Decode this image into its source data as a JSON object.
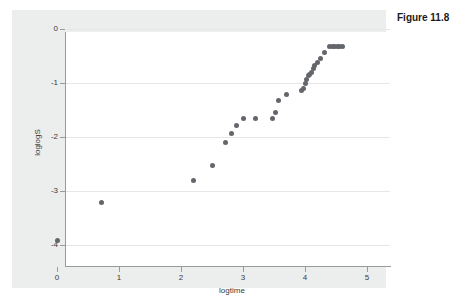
{
  "caption": {
    "text": "Figure 11.8"
  },
  "chart_data": {
    "type": "scatter",
    "title": "",
    "xlabel": "logtime",
    "ylabel": "loglogS",
    "xlim": [
      -0.05,
      5.25
    ],
    "ylim": [
      -4.3,
      0.12
    ],
    "xticks": [
      0,
      1,
      2,
      3,
      4,
      5
    ],
    "xtick_labels": [
      "0",
      "1",
      "2",
      "3",
      "4",
      "5"
    ],
    "yticks": [
      0,
      -1,
      -2,
      -3,
      -4
    ],
    "ytick_labels": [
      "0",
      "-1",
      "-2",
      "-3",
      "-4"
    ],
    "grid": "horizontal",
    "legend": "none",
    "marker_color": "#63666a",
    "series": [
      {
        "name": "loglogS vs logtime",
        "points": [
          [
            0.0,
            -3.91
          ],
          [
            0.72,
            -3.22
          ],
          [
            2.2,
            -2.81
          ],
          [
            2.5,
            -2.52
          ],
          [
            2.72,
            -2.11
          ],
          [
            2.82,
            -1.93
          ],
          [
            2.9,
            -1.78
          ],
          [
            3.0,
            -1.65
          ],
          [
            3.2,
            -1.65
          ],
          [
            3.48,
            -1.65
          ],
          [
            3.52,
            -1.55
          ],
          [
            3.58,
            -1.33
          ],
          [
            3.7,
            -1.22
          ],
          [
            3.94,
            -1.14
          ],
          [
            3.97,
            -1.1
          ],
          [
            4.0,
            -1.0
          ],
          [
            4.02,
            -0.94
          ],
          [
            4.05,
            -0.87
          ],
          [
            4.08,
            -0.84
          ],
          [
            4.1,
            -0.8
          ],
          [
            4.13,
            -0.73
          ],
          [
            4.16,
            -0.68
          ],
          [
            4.2,
            -0.62
          ],
          [
            4.25,
            -0.55
          ],
          [
            4.32,
            -0.44
          ],
          [
            4.4,
            -0.33
          ],
          [
            4.44,
            -0.32
          ],
          [
            4.48,
            -0.32
          ],
          [
            4.52,
            -0.32
          ],
          [
            4.56,
            -0.32
          ],
          [
            4.6,
            -0.32
          ]
        ]
      }
    ]
  },
  "colors": {
    "frame_background": "#eceded",
    "plot_background": "#ffffff",
    "axis": "#9a9a9a",
    "gridline": "#e6e6e6",
    "marker": "#63666a",
    "text": "#3b3b3b"
  }
}
